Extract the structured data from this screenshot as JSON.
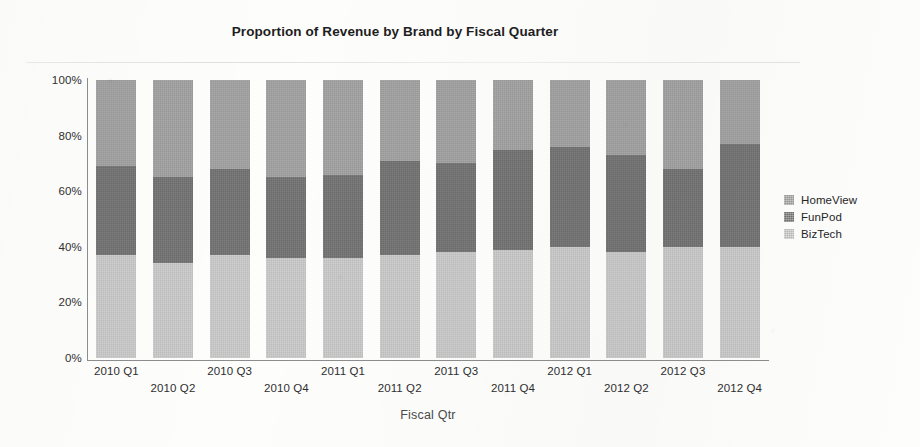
{
  "chart_data": {
    "type": "bar",
    "subtype": "stacked-100-percent",
    "title": "Proportion of Revenue by Brand by Fiscal Quarter",
    "xlabel": "Fiscal Qtr",
    "ylabel": "",
    "ylim": [
      0,
      100
    ],
    "ytick_labels": [
      "100%",
      "80%",
      "60%",
      "40%",
      "20%",
      "0%"
    ],
    "ytick_values": [
      100,
      80,
      60,
      40,
      20,
      0
    ],
    "grid": false,
    "legend_position": "right",
    "categories": [
      "2010 Q1",
      "2010 Q2",
      "2010 Q3",
      "2010 Q4",
      "2011 Q1",
      "2011 Q2",
      "2011 Q3",
      "2011 Q4",
      "2012 Q1",
      "2012 Q2",
      "2012 Q3",
      "2012 Q4"
    ],
    "series": [
      {
        "name": "BizTech",
        "color": "#cfcfcf",
        "values": [
          37,
          34,
          37,
          36,
          36,
          37,
          38,
          39,
          40,
          38,
          40,
          40
        ]
      },
      {
        "name": "FunPod",
        "color": "#7d7d7d",
        "values": [
          32,
          31,
          31,
          29,
          30,
          34,
          32,
          36,
          36,
          35,
          28,
          37
        ]
      },
      {
        "name": "HomeView",
        "color": "#a9a9a9",
        "values": [
          31,
          35,
          32,
          35,
          34,
          29,
          30,
          25,
          24,
          27,
          32,
          23
        ]
      }
    ],
    "stack_order_bottom_to_top": [
      "BizTech",
      "FunPod",
      "HomeView"
    ],
    "cumulative_tops": {
      "BizTech": [
        37,
        34,
        37,
        36,
        36,
        37,
        38,
        39,
        40,
        38,
        40,
        40
      ],
      "FunPod": [
        69,
        65,
        68,
        65,
        66,
        71,
        70,
        75,
        76,
        73,
        68,
        77
      ],
      "HomeView": [
        100,
        100,
        100,
        100,
        100,
        100,
        100,
        100,
        100,
        100,
        100,
        100
      ]
    }
  },
  "legend": {
    "entries": [
      {
        "label": "HomeView",
        "color": "#a9a9a9"
      },
      {
        "label": "FunPod",
        "color": "#7d7d7d"
      },
      {
        "label": "BizTech",
        "color": "#cfcfcf"
      }
    ]
  }
}
